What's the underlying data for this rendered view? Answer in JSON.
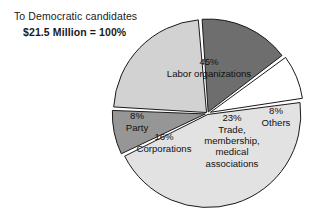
{
  "caption": {
    "line1": "To Democratic candidates",
    "line2": "$21.5 Million = 100%"
  },
  "chart_data": {
    "type": "pie",
    "title": "To Democratic candidates",
    "subtitle": "$21.5 Million = 100%",
    "total_label": "$21.5 Million",
    "total_percent": "100%",
    "units": "percent of $21.5 Million",
    "legend": "none (labels inside slices)",
    "grid": false,
    "categories": [
      "Labor organizations",
      "Others",
      "Trade, membership, medical associations",
      "Corporations",
      "Party"
    ],
    "values": [
      45,
      8,
      23,
      16,
      8
    ],
    "colors": [
      "#e2e2e2",
      "#969696",
      "#d2d2d2",
      "#6e6e6e",
      "#ffffff"
    ],
    "slices": [
      {
        "name": "labor-organizations",
        "percent_label": "45%",
        "value": 45,
        "label_lines": [
          "45%",
          "Labor organizations"
        ],
        "color": "#e2e2e2",
        "label_x": 209,
        "label_y": 68
      },
      {
        "name": "others",
        "percent_label": "8%",
        "value": 8,
        "label_lines": [
          "8%",
          "Others"
        ],
        "color": "#969696",
        "label_x": 276,
        "label_y": 117
      },
      {
        "name": "trade-membership-medical-associations",
        "percent_label": "23%",
        "value": 23,
        "label_lines": [
          "23%",
          "Trade,",
          "membership,",
          "medical",
          "associations"
        ],
        "color": "#d2d2d2",
        "label_x": 232,
        "label_y": 141
      },
      {
        "name": "corporations",
        "percent_label": "16%",
        "value": 16,
        "label_lines": [
          "16%",
          "Corporations"
        ],
        "color": "#6e6e6e",
        "label_x": 164,
        "label_y": 143
      },
      {
        "name": "party",
        "percent_label": "8%",
        "value": 8,
        "label_lines": [
          "8%",
          "Party"
        ],
        "color": "#ffffff",
        "label_x": 137,
        "label_y": 122
      }
    ]
  }
}
